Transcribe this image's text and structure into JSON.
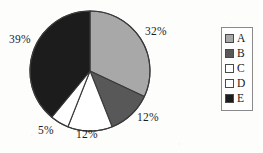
{
  "figure": {
    "background_color": "#fdfdfc",
    "geometry": {
      "cx": 90,
      "cy": 71,
      "r": 60
    }
  },
  "legend": {
    "position": "right",
    "border_color": "#8a8a8a",
    "entries": [
      {
        "label": "A",
        "color": "#a8a8a8"
      },
      {
        "label": "B",
        "color": "#585858"
      },
      {
        "label": "C",
        "color": "#ffffff"
      },
      {
        "label": "D",
        "color": "#ffffff"
      },
      {
        "label": "E",
        "color": "#1c1c1c"
      }
    ]
  },
  "labels": {
    "a": "32%",
    "b": "12%",
    "c": "12%",
    "d": "5%",
    "e": "39%"
  },
  "chart_data": {
    "type": "pie",
    "title": "",
    "xlabel": "",
    "ylabel": "",
    "start_angle_deg": 90,
    "direction": "clockwise",
    "grid": false,
    "legend_position": "right",
    "categories": [
      "A",
      "B",
      "C",
      "D",
      "E"
    ],
    "values": [
      32,
      12,
      12,
      5,
      39
    ],
    "value_labels": [
      "32%",
      "12%",
      "12%",
      "5%",
      "39%"
    ],
    "units": "percent",
    "total": 100,
    "colors": [
      "#a8a8a8",
      "#585858",
      "#ffffff",
      "#ffffff",
      "#1c1c1c"
    ],
    "slice_outline_color": "#3a3a3a",
    "series": [
      {
        "name": "Share",
        "values": [
          32,
          12,
          12,
          5,
          39
        ]
      }
    ]
  }
}
